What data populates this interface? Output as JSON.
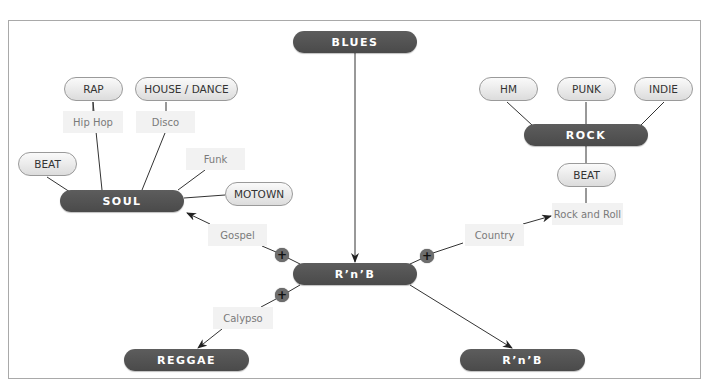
{
  "diagram": {
    "colors": {
      "dark_node": "#4f4f4f",
      "light_node": "#e6e6e6",
      "label_bg": "#f2f2f2",
      "frame": "#a9a9a9",
      "line": "#333333"
    },
    "hubs": {
      "blues": "BLUES",
      "rnb_center": "R’n’B",
      "soul": "SOUL",
      "rock": "ROCK",
      "reggae": "REGGAE",
      "rnb_bottom": "R’n’B"
    },
    "genres": {
      "rap": "RAP",
      "house_dance": "HOUSE / DANCE",
      "beat_left": "BEAT",
      "motown": "MOTOWN",
      "hm": "HM",
      "punk": "PUNK",
      "indie": "INDIE",
      "beat_right": "BEAT"
    },
    "labels": {
      "hip_hop": "Hip Hop",
      "disco": "Disco",
      "funk": "Funk",
      "gospel": "Gospel",
      "calypso": "Calypso",
      "country": "Country",
      "rock_and_roll": "Rock and Roll"
    },
    "markers": {
      "plus": "+"
    },
    "icons": {
      "expand_marker": "plus-circle-icon",
      "arrowhead": "arrow-icon"
    }
  }
}
